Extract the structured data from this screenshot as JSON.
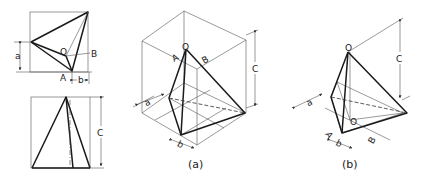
{
  "figure": {
    "top_view": {
      "labels": {
        "O": "O",
        "A": "A",
        "B": "B",
        "a": "a",
        "b": "b"
      }
    },
    "front_view": {
      "labels": {
        "c": "C"
      }
    },
    "iso_a": {
      "labels": {
        "O": "O",
        "A": "A",
        "B": "B",
        "a": "a",
        "b": "b",
        "c": "C"
      },
      "caption": "(a)"
    },
    "iso_b": {
      "labels": {
        "O_top": "O",
        "O_base": "O",
        "A": "A",
        "B": "B",
        "a": "a",
        "b": "b",
        "c": "C"
      },
      "caption": "(b)"
    }
  }
}
